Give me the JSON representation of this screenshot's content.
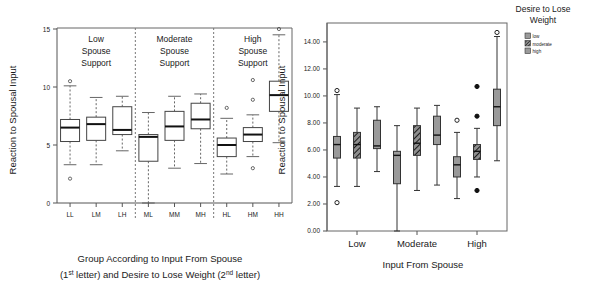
{
  "figure": {
    "name": "two-panel-boxplot-figure",
    "width": 613,
    "height": 295
  },
  "left_panel": {
    "ylabel": "Reaction to Spousal Input",
    "xlabel_line1": "Group According to Input From Spouse",
    "xlabel_line2_a": "(1",
    "xlabel_line2_sup1": "st",
    "xlabel_line2_b": " letter) and Desire to Lose Weight (2",
    "xlabel_line2_sup2": "nd",
    "xlabel_line2_c": " letter)",
    "group_labels": [
      "Low Spouse Support",
      "Moderate Spouse Support",
      "High Spouse Support"
    ],
    "group_label_lines": [
      [
        "Low",
        "Spouse",
        "Support"
      ],
      [
        "Moderate",
        "Spouse",
        "Support"
      ],
      [
        "High",
        "Spouse",
        "Support"
      ]
    ],
    "yticks": [
      "0",
      "5",
      "10",
      "15"
    ]
  },
  "right_panel": {
    "ylabel": "Reaction to Spousal Input",
    "xlabel": "Input From Spouse",
    "xticks": [
      "Low",
      "Moderate",
      "High"
    ],
    "yticks": [
      "0.00",
      "2.00",
      "4.00",
      "6.00",
      "8.00",
      "10.00",
      "12.00",
      "14.00"
    ],
    "legend_title_line1": "Desire to Lose",
    "legend_title_line2": "Weight",
    "legend_items": [
      {
        "label": "low",
        "fill": "#9a9a9a",
        "pattern": "solid"
      },
      {
        "label": "moderate",
        "fill": "#8e8e8e",
        "pattern": "hatch"
      },
      {
        "label": "high",
        "fill": "#9a9a9a",
        "pattern": "solid"
      }
    ]
  },
  "chart_data": [
    {
      "type": "box",
      "panel": "left",
      "title": "",
      "xlabel": "Group According to Input From Spouse (1st letter) and Desire to Lose Weight (2nd letter)",
      "ylabel": "Reaction to Spousal Input",
      "ylim": [
        0,
        15
      ],
      "yticks": [
        0,
        5,
        10,
        15
      ],
      "grid": false,
      "categories": [
        "LL",
        "LM",
        "LH",
        "ML",
        "MM",
        "MH",
        "HL",
        "HM",
        "HH"
      ],
      "groups": [
        "Low Spouse Support",
        "Moderate Spouse Support",
        "High Spouse Support"
      ],
      "boxes": [
        {
          "label": "LL",
          "min": 3.3,
          "q1": 5.3,
          "median": 6.5,
          "q3": 7.2,
          "max": 10.1,
          "outliers": [
            10.5,
            2.1
          ]
        },
        {
          "label": "LM",
          "min": 3.3,
          "q1": 5.4,
          "median": 6.8,
          "q3": 7.4,
          "max": 9.1,
          "outliers": []
        },
        {
          "label": "LH",
          "min": 4.5,
          "q1": 5.9,
          "median": 6.3,
          "q3": 8.3,
          "max": 9.2,
          "outliers": []
        },
        {
          "label": "ML",
          "min": 0.0,
          "q1": 3.6,
          "median": 5.7,
          "q3": 5.9,
          "max": 7.8,
          "outliers": []
        },
        {
          "label": "MM",
          "min": 3.0,
          "q1": 5.4,
          "median": 6.6,
          "q3": 7.9,
          "max": 9.2,
          "outliers": []
        },
        {
          "label": "MH",
          "min": 3.4,
          "q1": 6.4,
          "median": 7.2,
          "q3": 8.6,
          "max": 9.4,
          "outliers": []
        },
        {
          "label": "HL",
          "min": 2.5,
          "q1": 4.0,
          "median": 5.0,
          "q3": 5.6,
          "max": 7.3,
          "outliers": [
            8.2
          ]
        },
        {
          "label": "HM",
          "min": 4.0,
          "q1": 5.3,
          "median": 5.9,
          "q3": 6.5,
          "max": 7.6,
          "outliers": [
            10.6,
            8.9,
            3.0
          ]
        },
        {
          "label": "HH",
          "min": 5.2,
          "q1": 7.9,
          "median": 9.3,
          "q3": 10.5,
          "max": 14.5,
          "outliers": [
            15.0
          ]
        }
      ]
    },
    {
      "type": "box",
      "panel": "right",
      "title": "",
      "xlabel": "Input From Spouse",
      "ylabel": "Reaction to Spousal Input",
      "ylim": [
        0,
        15
      ],
      "yticks": [
        0,
        2,
        4,
        6,
        8,
        10,
        12,
        14
      ],
      "grid": false,
      "categories": [
        "Low",
        "Moderate",
        "High"
      ],
      "legend_position": "right",
      "series": [
        {
          "name": "low",
          "boxes": [
            {
              "category": "Low",
              "min": 3.3,
              "q1": 5.4,
              "median": 6.4,
              "q3": 7.0,
              "max": 10.1,
              "outliers": [
                10.4,
                2.1
              ],
              "outlier_types": [
                "open",
                "open"
              ]
            },
            {
              "category": "Moderate",
              "min": 0.0,
              "q1": 3.5,
              "median": 5.6,
              "q3": 5.9,
              "max": 7.8,
              "outliers": [],
              "outlier_types": []
            },
            {
              "category": "High",
              "min": 2.4,
              "q1": 4.0,
              "median": 4.9,
              "q3": 5.5,
              "max": 7.3,
              "outliers": [
                8.2
              ],
              "outlier_types": [
                "open"
              ]
            }
          ]
        },
        {
          "name": "moderate",
          "boxes": [
            {
              "category": "Low",
              "min": 3.3,
              "q1": 5.4,
              "median": 6.4,
              "q3": 7.3,
              "max": 9.1,
              "outliers": [],
              "outlier_types": []
            },
            {
              "category": "Moderate",
              "min": 3.0,
              "q1": 5.6,
              "median": 6.5,
              "q3": 7.8,
              "max": 9.1,
              "outliers": [],
              "outlier_types": []
            },
            {
              "category": "High",
              "min": 4.0,
              "q1": 5.3,
              "median": 5.9,
              "q3": 6.4,
              "max": 7.6,
              "outliers": [
                10.7,
                8.5,
                3.0
              ],
              "outlier_types": [
                "fill",
                "fill",
                "fill"
              ]
            }
          ]
        },
        {
          "name": "high",
          "boxes": [
            {
              "category": "Low",
              "min": 4.4,
              "q1": 6.1,
              "median": 6.3,
              "q3": 8.2,
              "max": 9.2,
              "outliers": [],
              "outlier_types": []
            },
            {
              "category": "Moderate",
              "min": 3.4,
              "q1": 6.4,
              "median": 7.1,
              "q3": 8.5,
              "max": 9.3,
              "outliers": [],
              "outlier_types": []
            },
            {
              "category": "High",
              "min": 5.2,
              "q1": 7.8,
              "median": 9.2,
              "q3": 10.5,
              "max": 14.4,
              "outliers": [
                14.7
              ],
              "outlier_types": [
                "open"
              ]
            }
          ]
        }
      ]
    }
  ]
}
